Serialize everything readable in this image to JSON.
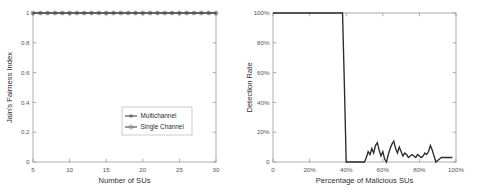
{
  "figures": [
    {
      "id": "jains-fairness-index",
      "chart_data": {
        "type": "line",
        "title": "",
        "xlabel": "Number of SUs",
        "ylabel": "Jain's Fairness Index",
        "xlim": [
          5,
          30
        ],
        "ylim": [
          0,
          1
        ],
        "xticks": [
          5,
          10,
          15,
          20,
          25,
          30
        ],
        "xticklabels": [
          "5",
          "10",
          "15",
          "20",
          "25",
          "30"
        ],
        "yticks": [
          0,
          0.2,
          0.4,
          0.6,
          0.8,
          1
        ],
        "yticklabels": [
          "0",
          "0.2",
          "0.4",
          "0.6",
          "0.8",
          "1"
        ],
        "grid": false,
        "legend_position": "lower-right",
        "x": [
          5,
          6,
          7,
          8,
          9,
          10,
          11,
          12,
          13,
          14,
          15,
          16,
          17,
          18,
          19,
          20,
          21,
          22,
          23,
          24,
          25,
          26,
          27,
          28,
          29,
          30
        ],
        "series": [
          {
            "name": "Multichannel",
            "marker": "star",
            "values": [
              1,
              1,
              1,
              1,
              1,
              1,
              1,
              1,
              1,
              1,
              1,
              1,
              1,
              1,
              1,
              1,
              1,
              1,
              1,
              1,
              1,
              1,
              1,
              1,
              1,
              1
            ]
          },
          {
            "name": "Single Channel",
            "marker": "circle",
            "values": [
              1,
              1,
              1,
              1,
              1,
              1,
              1,
              1,
              1,
              1,
              1,
              1,
              1,
              1,
              1,
              1,
              1,
              1,
              1,
              1,
              1,
              1,
              1,
              1,
              1,
              1
            ]
          }
        ]
      }
    },
    {
      "id": "detection-rate",
      "chart_data": {
        "type": "line",
        "title": "",
        "xlabel": "Percentage of Malicious SUs",
        "ylabel": "Detection Rate",
        "xlim": [
          0,
          100
        ],
        "ylim": [
          0,
          100
        ],
        "xticks": [
          0,
          20,
          40,
          60,
          80,
          100
        ],
        "xticklabels": [
          "0",
          "20%",
          "40%",
          "60%",
          "80%",
          "100%"
        ],
        "yticks": [
          0,
          20,
          40,
          60,
          80,
          100
        ],
        "yticklabels": [
          "0",
          "20%",
          "40%",
          "60%",
          "80%",
          "100%"
        ],
        "grid": false,
        "legend_position": "none",
        "series": [
          {
            "name": "Detection Rate",
            "marker": "none",
            "x": [
              0,
              2,
              4,
              6,
              8,
              10,
              12,
              14,
              16,
              18,
              20,
              22,
              24,
              26,
              28,
              30,
              32,
              34,
              36,
              38,
              39,
              40,
              42,
              44,
              46,
              48,
              50,
              51,
              52,
              53,
              54,
              55,
              56,
              57,
              58,
              59,
              60,
              61,
              62,
              63,
              64,
              65,
              66,
              67,
              68,
              69,
              70,
              71,
              72,
              73,
              74,
              75,
              76,
              77,
              78,
              79,
              80,
              81,
              82,
              83,
              84,
              85,
              86,
              87,
              88,
              89,
              90,
              91,
              92,
              94,
              96,
              98
            ],
            "values": [
              100,
              100,
              100,
              100,
              100,
              100,
              100,
              100,
              100,
              100,
              100,
              100,
              100,
              100,
              100,
              100,
              100,
              100,
              100,
              100,
              52,
              0,
              0,
              0,
              0,
              0,
              0,
              3,
              7,
              5,
              9,
              6,
              11,
              13,
              8,
              4,
              7,
              2,
              0,
              5,
              9,
              12,
              14,
              9,
              6,
              10,
              7,
              4,
              6,
              5,
              3,
              4,
              5,
              4,
              3,
              5,
              4,
              3,
              4,
              6,
              5,
              7,
              11,
              8,
              4,
              0,
              1,
              2,
              3,
              3,
              3,
              3
            ]
          }
        ]
      }
    }
  ]
}
